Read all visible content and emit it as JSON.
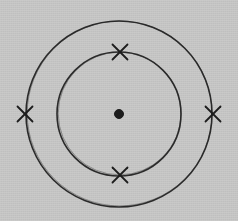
{
  "figure": {
    "background_color": "#cacac9",
    "ink_color": "#1d1d1d",
    "canvas": {
      "width": 238,
      "height": 221
    }
  },
  "chart_data": {
    "type": "scatter",
    "xlabel": "",
    "ylabel": "",
    "center": {
      "x": 119,
      "y": 114
    },
    "nucleus": {
      "label": "nucleus",
      "shape": "filled-dot",
      "x": 119,
      "y": 114,
      "radius": 4.5,
      "color": "#1d1d1d"
    },
    "shells": [
      {
        "name": "inner-shell",
        "shell_number": 1,
        "radius": 62,
        "electron_count": 2,
        "stroke_width": 1.6,
        "color": "#1d1d1d"
      },
      {
        "name": "outer-shell",
        "shell_number": 2,
        "radius": 93,
        "electron_count": 2,
        "stroke_width": 1.6,
        "color": "#1d1d1d"
      }
    ],
    "electrons": [
      {
        "label": "electron-inner-top",
        "marker": "x",
        "shell": "inner-shell",
        "angle_deg": 90,
        "x": 120,
        "y": 52,
        "size": 15
      },
      {
        "label": "electron-inner-bottom",
        "marker": "x",
        "shell": "inner-shell",
        "angle_deg": 270,
        "x": 120,
        "y": 175,
        "size": 15
      },
      {
        "label": "electron-outer-left",
        "marker": "x",
        "shell": "outer-shell",
        "angle_deg": 180,
        "x": 25,
        "y": 114,
        "size": 15
      },
      {
        "label": "electron-outer-right",
        "marker": "x",
        "shell": "outer-shell",
        "angle_deg": 0,
        "x": 213,
        "y": 114,
        "size": 15
      }
    ]
  }
}
